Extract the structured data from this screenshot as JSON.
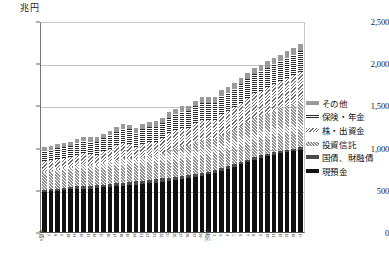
{
  "chart_data": {
    "type": "bar",
    "stacked": true,
    "title": "",
    "subtitle": "",
    "unit_label": "兆円",
    "ylabel": "兆円",
    "xlabel": "",
    "ylim": [
      0,
      2500
    ],
    "yticks": [
      0,
      500,
      1000,
      1500,
      2000,
      2500
    ],
    "ytick_labels": [
      "0",
      "500",
      "1,000",
      "1,500",
      "2,000",
      "2,500"
    ],
    "grid": true,
    "legend_position": "right",
    "legend_order_top_to_bottom": [
      "その他",
      "保険・年金",
      "株・出資金",
      "投資信託",
      "国債、財融債",
      "現預金"
    ],
    "categories": [
      "平成6",
      "7",
      "8",
      "9",
      "10",
      "11",
      "12",
      "13",
      "14",
      "15",
      "16",
      "17",
      "18",
      "19",
      "20",
      "21",
      "22",
      "23",
      "24",
      "25",
      "26",
      "27",
      "28",
      "29",
      "30",
      "令和元",
      "2",
      "3",
      "4",
      "5",
      "6",
      "7",
      "8",
      "9",
      "10",
      "11",
      "12",
      "13",
      "14",
      "15"
    ],
    "series": [
      {
        "name": "現預金",
        "key": "cash",
        "pattern": "solid-black",
        "color": "#111111",
        "values": [
          480,
          485,
          490,
          500,
          505,
          510,
          512,
          515,
          520,
          528,
          535,
          540,
          545,
          552,
          560,
          568,
          575,
          585,
          595,
          605,
          615,
          628,
          640,
          655,
          668,
          682,
          700,
          720,
          745,
          770,
          800,
          830,
          858,
          880,
          900,
          918,
          932,
          945,
          958,
          975
        ]
      },
      {
        "name": "国債、財融債",
        "key": "bond",
        "pattern": "solid-darkgray",
        "color": "#4a4a4a",
        "values": [
          22,
          24,
          25,
          26,
          28,
          30,
          31,
          32,
          33,
          34,
          35,
          36,
          37,
          38,
          39,
          40,
          41,
          42,
          42,
          41,
          40,
          39,
          38,
          37,
          36,
          35,
          34,
          33,
          32,
          31,
          30,
          29,
          28,
          27,
          26,
          25,
          25,
          25,
          26,
          27
        ]
      },
      {
        "name": "投資信託",
        "key": "trust",
        "pattern": "diagonal-hatch-45",
        "color": "#cfcfcf",
        "values": [
          215,
          220,
          228,
          232,
          236,
          245,
          252,
          248,
          244,
          255,
          268,
          282,
          292,
          288,
          268,
          285,
          295,
          290,
          305,
          330,
          345,
          355,
          352,
          372,
          385,
          382,
          372,
          398,
          405,
          418,
          430,
          448,
          462,
          470,
          482,
          495,
          508,
          520,
          535,
          550
        ]
      },
      {
        "name": "株・出資金",
        "key": "stock",
        "pattern": "diagonal-hatch-135",
        "color": "#e2e2e2",
        "values": [
          120,
          122,
          125,
          120,
          115,
          132,
          140,
          128,
          120,
          138,
          150,
          168,
          178,
          168,
          138,
          152,
          160,
          152,
          168,
          195,
          205,
          212,
          208,
          228,
          238,
          232,
          222,
          248,
          255,
          262,
          272,
          285,
          295,
          300,
          308,
          315,
          322,
          330,
          338,
          348
        ]
      },
      {
        "name": "保険・年金",
        "key": "ins",
        "pattern": "horizontal-stripes",
        "color": "#d8d8d8",
        "values": [
          120,
          124,
          128,
          132,
          136,
          140,
          144,
          148,
          152,
          156,
          160,
          164,
          168,
          170,
          172,
          175,
          178,
          180,
          183,
          186,
          189,
          192,
          195,
          198,
          200,
          203,
          206,
          209,
          212,
          215,
          218,
          221,
          224,
          227,
          230,
          233,
          236,
          239,
          242,
          245
        ]
      },
      {
        "name": "その他",
        "key": "other",
        "pattern": "solid-gray",
        "color": "#9a9a9a",
        "values": [
          45,
          46,
          47,
          48,
          49,
          50,
          51,
          52,
          53,
          54,
          55,
          56,
          57,
          58,
          58,
          59,
          60,
          61,
          62,
          63,
          64,
          65,
          66,
          67,
          68,
          69,
          70,
          71,
          72,
          73,
          74,
          75,
          76,
          77,
          78,
          79,
          80,
          81,
          82,
          83
        ]
      }
    ],
    "totals_approx": [
      1002,
      1021,
      1043,
      1058,
      1069,
      1107,
      1130,
      1123,
      1122,
      1165,
      1203,
      1246,
      1277,
      1274,
      1235,
      1279,
      1309,
      1310,
      1355,
      1420,
      1458,
      1491,
      1499,
      1557,
      1595,
      1603,
      1604,
      1679,
      1721,
      1769,
      1824,
      1888,
      1943,
      1981,
      2024,
      2065,
      2103,
      2140,
      2181,
      2228
    ]
  },
  "legend": {
    "items": [
      {
        "label": "その他",
        "key": "other"
      },
      {
        "label": "保険・年金",
        "key": "ins"
      },
      {
        "label": "株・出資金",
        "key": "stock"
      },
      {
        "label": "投資信託",
        "key": "trust"
      },
      {
        "label": "国債、財融債",
        "key": "bond"
      },
      {
        "label": "現預金",
        "key": "cash"
      }
    ]
  },
  "axis": {
    "unit": "兆円"
  }
}
